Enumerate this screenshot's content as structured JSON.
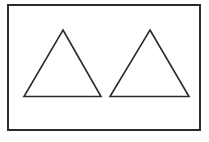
{
  "figure": {
    "background_color": "#ffffff",
    "stroke_color": "#2b2b2b",
    "frame": {
      "name": "outer-rectangle",
      "x": 8,
      "y": 5,
      "width": 192,
      "height": 125,
      "stroke_width": 2,
      "fill": "none"
    },
    "shapes": [
      {
        "name": "left-triangle",
        "type": "triangle",
        "points": "63,30 101,96.5 24,96.5",
        "apex": {
          "x": 63,
          "y": 30
        },
        "base_left": {
          "x": 24,
          "y": 96.5
        },
        "base_right": {
          "x": 101,
          "y": 96.5
        },
        "base_width": 77,
        "height": 66.5,
        "stroke_width": 1.6,
        "fill": "none"
      },
      {
        "name": "right-triangle",
        "type": "triangle",
        "points": "150,30 189,96.5 110,96.5",
        "apex": {
          "x": 150,
          "y": 30
        },
        "base_left": {
          "x": 110,
          "y": 96.5
        },
        "base_right": {
          "x": 189,
          "y": 96.5
        },
        "base_width": 79,
        "height": 66.5,
        "stroke_width": 1.6,
        "fill": "none"
      }
    ],
    "canvas": {
      "width": 209,
      "height": 142
    }
  }
}
